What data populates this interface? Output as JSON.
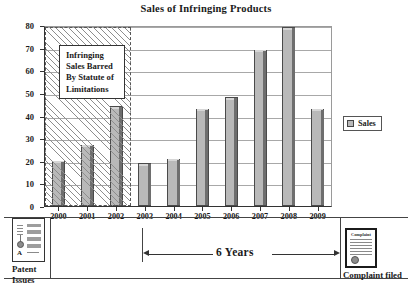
{
  "chart_data": {
    "type": "bar",
    "title": "Sales of Infringing Products",
    "xlabel": "",
    "ylabel": "",
    "categories": [
      "2000",
      "2001",
      "2002",
      "2003",
      "2004",
      "2005",
      "2006",
      "2007",
      "2008",
      "2009"
    ],
    "values": [
      20,
      27,
      44,
      19,
      21,
      43,
      48,
      69,
      79,
      43
    ],
    "series": [
      {
        "name": "Sales",
        "values": [
          20,
          27,
          44,
          19,
          21,
          43,
          48,
          69,
          79,
          43
        ]
      }
    ],
    "ylim": [
      0,
      80
    ],
    "ytick_labels": [
      "0",
      "10",
      "20",
      "30",
      "40",
      "50",
      "60",
      "70",
      "80"
    ],
    "ytick_values": [
      0,
      10,
      20,
      30,
      40,
      50,
      60,
      70,
      80
    ],
    "grid": true,
    "legend_position": "right",
    "legend_entries": [
      "Sales"
    ],
    "annotations": [
      {
        "name": "barred-region",
        "text": "Infringing Sales Barred By Statute of Limitations",
        "covers": [
          "2000",
          "2001",
          "2002"
        ]
      },
      {
        "name": "six-years-span",
        "text": "6 Years",
        "from": "2003",
        "to": "2009"
      },
      {
        "name": "patent-issues-marker",
        "text": "Patent Issues"
      },
      {
        "name": "complaint-filed-marker",
        "text": "Complaint filed"
      }
    ],
    "colors": {
      "bar_fill": "#b9b9b9",
      "bar_edge": "#4a4a4a",
      "bar_shadow": "#6e6e6e",
      "gridline": "#a8a8a8",
      "axis": "#333333",
      "hatch": "#8d8d8d",
      "background": "#ffffff"
    }
  },
  "callout": {
    "line1": "Infringing",
    "line2": "Sales Barred",
    "line3": "By Statute of",
    "line4": "Limitations"
  },
  "legend": {
    "label": "Sales"
  },
  "footer": {
    "patent_line1": "Patent",
    "patent_line2": "Issues",
    "span_label": "6 Years",
    "complaint_label": "Complaint filed",
    "complaint_doc_title": "Complaint"
  }
}
